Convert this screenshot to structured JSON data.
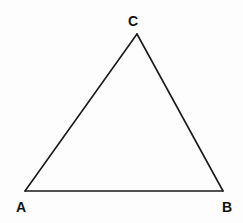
{
  "diagram": {
    "type": "triangle",
    "stroke_color": "#1a1a1a",
    "background_color": "#fdfdfd",
    "vertices": [
      {
        "id": "A",
        "label": "A",
        "x": 25,
        "y": 191,
        "label_x": 21,
        "label_y": 212
      },
      {
        "id": "B",
        "label": "B",
        "x": 223,
        "y": 191,
        "label_x": 227,
        "label_y": 212
      },
      {
        "id": "C",
        "label": "C",
        "x": 137,
        "y": 34,
        "label_x": 133,
        "label_y": 26
      }
    ],
    "edges": [
      {
        "from": "A",
        "to": "B"
      },
      {
        "from": "B",
        "to": "C"
      },
      {
        "from": "C",
        "to": "A"
      }
    ]
  }
}
